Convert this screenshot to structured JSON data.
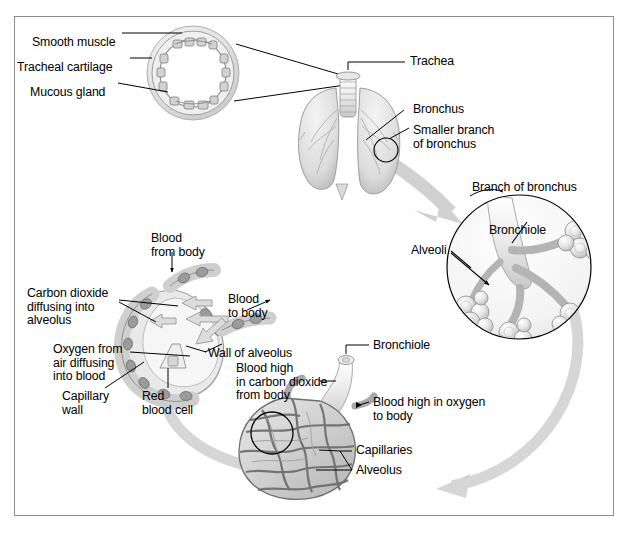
{
  "figure": {
    "border_color": "#8d8d8d",
    "background_color": "#ffffff",
    "ink_color": "#000000",
    "arrow_color": "#c9c9c9"
  },
  "panels": {
    "trachea_cross_section": {
      "name": "Trachea cross-section inset",
      "labels": [
        {
          "id": "smooth-muscle",
          "text": "Smooth muscle",
          "x": 32,
          "y": 36,
          "align": "left"
        },
        {
          "id": "tracheal-cartilage",
          "text": "Tracheal cartilage",
          "x": 17,
          "y": 61,
          "align": "left"
        },
        {
          "id": "mucous-gland",
          "text": "Mucous gland",
          "x": 30,
          "y": 86,
          "align": "left"
        }
      ]
    },
    "lungs": {
      "name": "Lungs and airways overview",
      "labels": [
        {
          "id": "trachea",
          "text": "Trachea",
          "x": 410,
          "y": 65,
          "align": "left"
        },
        {
          "id": "bronchus",
          "text": "Bronchus",
          "x": 413,
          "y": 106,
          "align": "left"
        },
        {
          "id": "smaller-branch-of-bronchus",
          "text": "Smaller branch\nof bronchus",
          "x": 413,
          "y": 127,
          "align": "left"
        }
      ]
    },
    "bronchus_branch_circle": {
      "name": "Branch of bronchus magnified circle",
      "labels": [
        {
          "id": "branch-of-bronchus",
          "text": "Branch of bronchus",
          "x": 472,
          "y": 183,
          "align": "left"
        },
        {
          "id": "bronchiole-circle",
          "text": "Bronchiole",
          "x": 489,
          "y": 225,
          "align": "left"
        },
        {
          "id": "alveoli",
          "text": "Alveoli",
          "x": 413,
          "y": 245,
          "align": "left"
        }
      ]
    },
    "alveolus_capillaries": {
      "name": "Alveolus with capillary network",
      "labels": [
        {
          "id": "bronchiole-lower",
          "text": "Bronchiole",
          "x": 373,
          "y": 345,
          "align": "left"
        },
        {
          "id": "blood-high-co2",
          "text": "Blood high\nin carbon dioxide\nfrom body",
          "x": 237,
          "y": 368,
          "align": "left"
        },
        {
          "id": "blood-high-oxygen",
          "text": "Blood high in oxygen\nto body",
          "x": 373,
          "y": 400,
          "align": "left"
        },
        {
          "id": "capillaries",
          "text": "Capillaries",
          "x": 356,
          "y": 447,
          "align": "left"
        },
        {
          "id": "alveolus",
          "text": "Alveolus",
          "x": 356,
          "y": 468,
          "align": "left"
        }
      ]
    },
    "gas_exchange": {
      "name": "Gas exchange at the alveolar wall",
      "labels": [
        {
          "id": "blood-from-body",
          "text": "Blood\nfrom body",
          "x": 151,
          "y": 236,
          "align": "left"
        },
        {
          "id": "carbon-dioxide-diffusing",
          "text": "Carbon dioxide\ndiffusing into\nalveolus",
          "x": 28,
          "y": 290,
          "align": "left"
        },
        {
          "id": "blood-to-body",
          "text": "Blood\nto body",
          "x": 228,
          "y": 297,
          "align": "left"
        },
        {
          "id": "oxygen-from-air",
          "text": "Oxygen from\nair diffusing\ninto blood",
          "x": 54,
          "y": 346,
          "align": "left"
        },
        {
          "id": "wall-of-alveolus",
          "text": "Wall of alveolus",
          "x": 208,
          "y": 351,
          "align": "left"
        },
        {
          "id": "capillary-wall",
          "text": "Capillary\nwall",
          "x": 63,
          "y": 393,
          "align": "left"
        },
        {
          "id": "red-blood-cell",
          "text": "Red\nblood cell",
          "x": 143,
          "y": 393,
          "align": "left"
        }
      ]
    }
  }
}
